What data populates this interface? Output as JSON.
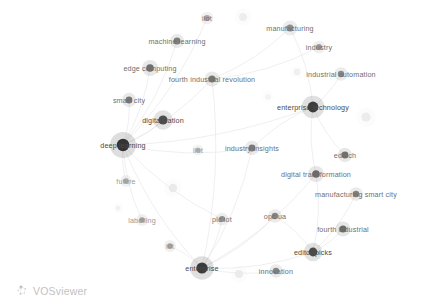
{
  "app": {
    "name": "VOSviewer",
    "watermark_label": "VOSviewer",
    "watermark_icon": "vosviewer-network-logo-icon",
    "canvas_width": 431,
    "canvas_height": 306,
    "background_color": "#ffffff"
  },
  "chart_data": {
    "type": "scatter",
    "title": "",
    "subtitle": "",
    "xlabel": "",
    "ylabel": "",
    "grid": false,
    "legend": "none",
    "visualization": "term co-occurrence network map (VOSviewer density/label view)",
    "xlim": [
      0,
      431
    ],
    "ylim": [
      0,
      306
    ],
    "node_color_scale": {
      "strong": "#3d3d3d",
      "medium": "#8c8c8c",
      "faint": "#dedede",
      "very_faint": "#eeeeee"
    },
    "edge_color": "#dcdcdc",
    "nodes": [
      {
        "label": "iiot",
        "x": 207,
        "y": 18,
        "size": 3.0,
        "weight": "medium",
        "label_dx": 0,
        "label_dy": 0,
        "shade": "#a8a8a8"
      },
      {
        "label": "manufacturing",
        "x": 290,
        "y": 28,
        "size": 3.6,
        "weight": "medium",
        "label_dx": 0,
        "label_dy": 0,
        "shade": "#8e8e8e"
      },
      {
        "label": "machine learning",
        "x": 177,
        "y": 41,
        "size": 3.4,
        "weight": "medium",
        "label_dx": 0,
        "label_dy": 0,
        "shade": "#7d7d7d"
      },
      {
        "label": "industry",
        "x": 319,
        "y": 47,
        "size": 3.0,
        "weight": "medium",
        "label_dx": 0,
        "label_dy": 0,
        "shade": "#9a9a9a"
      },
      {
        "label": "edge computing",
        "x": 150,
        "y": 68,
        "size": 3.8,
        "weight": "medium",
        "label_dx": 0,
        "label_dy": 0,
        "shade": "#6f6f6f"
      },
      {
        "label": "fourth industrial revolution",
        "x": 212,
        "y": 79,
        "size": 3.6,
        "weight": "medium",
        "label_dx": 0,
        "label_dy": 0,
        "shade": "#777777"
      },
      {
        "label": "industrial automation",
        "x": 341,
        "y": 74,
        "size": 3.2,
        "weight": "medium",
        "label_dx": 0,
        "label_dy": 0,
        "shade": "#8a8a8a"
      },
      {
        "label": "smart city",
        "x": 129,
        "y": 100,
        "size": 3.4,
        "weight": "medium",
        "label_dx": 0,
        "label_dy": 0,
        "shade": "#777777"
      },
      {
        "label": "enterprise technology",
        "x": 313,
        "y": 107,
        "size": 5.4,
        "weight": "strong",
        "label_dx": 0,
        "label_dy": 0,
        "shade": "#3d3d3d"
      },
      {
        "label": "digitalization",
        "x": 163,
        "y": 120,
        "size": 4.6,
        "weight": "strong",
        "label_dx": 0,
        "label_dy": 0,
        "shade": "#4f4f4f"
      },
      {
        "label": "deep learning",
        "x": 123,
        "y": 145,
        "size": 6.2,
        "weight": "strong",
        "label_dx": 0,
        "label_dy": 0,
        "shade": "#333333"
      },
      {
        "label": "iiot",
        "x": 198,
        "y": 150,
        "size": 2.6,
        "weight": "faint",
        "label_dx": 0,
        "label_dy": 0,
        "shade": "#b4b4b4"
      },
      {
        "label": "industry insights",
        "x": 252,
        "y": 148,
        "size": 3.4,
        "weight": "medium",
        "label_dx": 0,
        "label_dy": 0,
        "shade": "#7b7b7b"
      },
      {
        "label": "edtech",
        "x": 345,
        "y": 155,
        "size": 3.4,
        "weight": "medium",
        "label_dx": 0,
        "label_dy": 0,
        "shade": "#6f6f6f"
      },
      {
        "label": "digital transformation",
        "x": 316,
        "y": 174,
        "size": 3.8,
        "weight": "medium",
        "label_dx": 0,
        "label_dy": 0,
        "shade": "#6a6a6a"
      },
      {
        "label": "future",
        "x": 126,
        "y": 181,
        "size": 2.8,
        "weight": "faint",
        "label_dx": 0,
        "label_dy": 0,
        "shade": "#a8a8a8"
      },
      {
        "label": "manufacturing smart city",
        "x": 356,
        "y": 194,
        "size": 3.2,
        "weight": "medium",
        "label_dx": 0,
        "label_dy": 0,
        "shade": "#7f7f7f"
      },
      {
        "label": "labelling",
        "x": 142,
        "y": 220,
        "size": 2.8,
        "weight": "faint",
        "label_dx": 0,
        "label_dy": 0,
        "shade": "#a0a0a0"
      },
      {
        "label": "plc iot",
        "x": 222,
        "y": 219,
        "size": 3.0,
        "weight": "medium",
        "label_dx": 0,
        "label_dy": 0,
        "shade": "#8e8e8e"
      },
      {
        "label": "opc ua",
        "x": 275,
        "y": 216,
        "size": 3.2,
        "weight": "medium",
        "label_dx": 0,
        "label_dy": 0,
        "shade": "#858585"
      },
      {
        "label": "fourth industrial",
        "x": 343,
        "y": 229,
        "size": 3.6,
        "weight": "medium",
        "label_dx": 0,
        "label_dy": 0,
        "shade": "#6a6a6a"
      },
      {
        "label": "iot",
        "x": 170,
        "y": 246,
        "size": 2.8,
        "weight": "faint",
        "label_dx": 0,
        "label_dy": 0,
        "shade": "#a0a0a0"
      },
      {
        "label": "editor picks",
        "x": 313,
        "y": 252,
        "size": 4.4,
        "weight": "strong",
        "label_dx": 0,
        "label_dy": 0,
        "shade": "#4a4a4a"
      },
      {
        "label": "enterprise",
        "x": 202,
        "y": 268,
        "size": 5.6,
        "weight": "strong",
        "label_dx": 0,
        "label_dy": 0,
        "shade": "#3a3a3a"
      },
      {
        "label": "innovation",
        "x": 276,
        "y": 271,
        "size": 3.2,
        "weight": "medium",
        "label_dx": 0,
        "label_dy": 0,
        "shade": "#858585"
      }
    ],
    "unlabeled_nodes": [
      {
        "x": 243,
        "y": 17,
        "size": 4.0,
        "shade": "#ededed"
      },
      {
        "x": 297,
        "y": 72,
        "size": 3.4,
        "shade": "#f0f0f0"
      },
      {
        "x": 366,
        "y": 117,
        "size": 4.6,
        "shade": "#ececec"
      },
      {
        "x": 173,
        "y": 188,
        "size": 4.2,
        "shade": "#eaeaea"
      },
      {
        "x": 239,
        "y": 274,
        "size": 4.0,
        "shade": "#ebebeb"
      },
      {
        "x": 268,
        "y": 97,
        "size": 2.8,
        "shade": "#f2f2f2"
      },
      {
        "x": 118,
        "y": 208,
        "size": 2.6,
        "shade": "#f2f2f2"
      }
    ],
    "edges": [
      {
        "from": "deep learning",
        "to": "digitalization"
      },
      {
        "from": "deep learning",
        "to": "smart city"
      },
      {
        "from": "deep learning",
        "to": "edge computing"
      },
      {
        "from": "deep learning",
        "to": "machine learning"
      },
      {
        "from": "deep learning",
        "to": "fourth industrial revolution"
      },
      {
        "from": "deep learning",
        "to": "future"
      },
      {
        "from": "deep learning",
        "to": "labelling"
      },
      {
        "from": "deep learning",
        "to": "enterprise"
      },
      {
        "from": "deep learning",
        "to": "industry insights"
      },
      {
        "from": "deep learning",
        "to": "enterprise technology"
      },
      {
        "from": "deep learning",
        "to": "iiot-center"
      },
      {
        "from": "deep learning",
        "to": "plc iot"
      },
      {
        "from": "enterprise",
        "to": "plc iot"
      },
      {
        "from": "enterprise",
        "to": "opc ua"
      },
      {
        "from": "enterprise",
        "to": "iot"
      },
      {
        "from": "enterprise",
        "to": "innovation"
      },
      {
        "from": "enterprise",
        "to": "editor picks"
      },
      {
        "from": "enterprise",
        "to": "fourth industrial revolution"
      },
      {
        "from": "enterprise",
        "to": "industry insights"
      },
      {
        "from": "enterprise",
        "to": "digital transformation"
      },
      {
        "from": "enterprise technology",
        "to": "industry insights"
      },
      {
        "from": "enterprise technology",
        "to": "digital transformation"
      },
      {
        "from": "enterprise technology",
        "to": "industrial automation"
      },
      {
        "from": "enterprise technology",
        "to": "edtech"
      },
      {
        "from": "enterprise technology",
        "to": "manufacturing"
      },
      {
        "from": "editor picks",
        "to": "fourth industrial"
      },
      {
        "from": "editor picks",
        "to": "digital transformation"
      },
      {
        "from": "editor picks",
        "to": "manufacturing smart city"
      },
      {
        "from": "editor picks",
        "to": "opc ua"
      },
      {
        "from": "fourth industrial revolution",
        "to": "manufacturing"
      },
      {
        "from": "fourth industrial revolution",
        "to": "industry"
      }
    ]
  }
}
